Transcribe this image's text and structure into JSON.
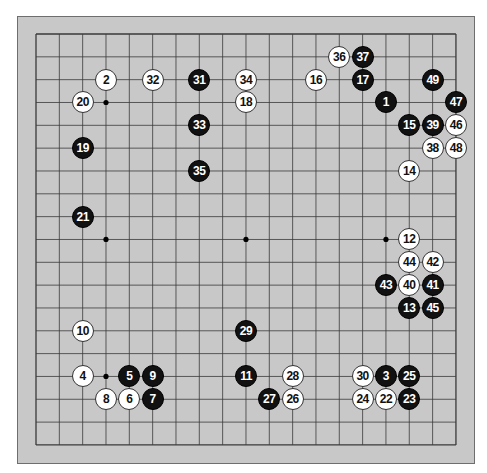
{
  "board": {
    "size": 19,
    "origin": {
      "x": 36,
      "y": 34
    },
    "spacing": {
      "x": 23.33,
      "y": 22.83
    },
    "colors": {
      "board": "#c8c8c8",
      "line": "#3a3a3a",
      "black": "#111111",
      "white": "#ffffff"
    },
    "star_points": [
      [
        3,
        3
      ],
      [
        9,
        3
      ],
      [
        15,
        3
      ],
      [
        3,
        9
      ],
      [
        9,
        9
      ],
      [
        15,
        9
      ],
      [
        3,
        15
      ],
      [
        9,
        15
      ],
      [
        15,
        15
      ]
    ]
  },
  "stones": [
    {
      "n": "1",
      "color": "black",
      "col": 15,
      "row": 3
    },
    {
      "n": "2",
      "color": "white",
      "col": 3,
      "row": 2
    },
    {
      "n": "3",
      "color": "black",
      "col": 15,
      "row": 15
    },
    {
      "n": "4",
      "color": "white",
      "col": 2,
      "row": 15
    },
    {
      "n": "5",
      "color": "black",
      "col": 4,
      "row": 15
    },
    {
      "n": "6",
      "color": "white",
      "col": 4,
      "row": 16
    },
    {
      "n": "7",
      "color": "black",
      "col": 5,
      "row": 16
    },
    {
      "n": "8",
      "color": "white",
      "col": 3,
      "row": 16
    },
    {
      "n": "9",
      "color": "black",
      "col": 5,
      "row": 15
    },
    {
      "n": "10",
      "color": "white",
      "col": 2,
      "row": 13
    },
    {
      "n": "11",
      "color": "black",
      "col": 9,
      "row": 15
    },
    {
      "n": "12",
      "color": "white",
      "col": 16,
      "row": 9
    },
    {
      "n": "13",
      "color": "black",
      "col": 16,
      "row": 12
    },
    {
      "n": "14",
      "color": "white",
      "col": 16,
      "row": 6
    },
    {
      "n": "15",
      "color": "black",
      "col": 16,
      "row": 4
    },
    {
      "n": "16",
      "color": "white",
      "col": 12,
      "row": 2
    },
    {
      "n": "17",
      "color": "black",
      "col": 14,
      "row": 2
    },
    {
      "n": "18",
      "color": "white",
      "col": 9,
      "row": 3
    },
    {
      "n": "19",
      "color": "black",
      "col": 2,
      "row": 5
    },
    {
      "n": "20",
      "color": "white",
      "col": 2,
      "row": 3
    },
    {
      "n": "21",
      "color": "black",
      "col": 2,
      "row": 8
    },
    {
      "n": "22",
      "color": "white",
      "col": 15,
      "row": 16
    },
    {
      "n": "23",
      "color": "black",
      "col": 16,
      "row": 16
    },
    {
      "n": "24",
      "color": "white",
      "col": 14,
      "row": 16
    },
    {
      "n": "25",
      "color": "black",
      "col": 16,
      "row": 15
    },
    {
      "n": "26",
      "color": "white",
      "col": 11,
      "row": 16
    },
    {
      "n": "27",
      "color": "black",
      "col": 10,
      "row": 16
    },
    {
      "n": "28",
      "color": "white",
      "col": 11,
      "row": 15
    },
    {
      "n": "29",
      "color": "black",
      "col": 9,
      "row": 13
    },
    {
      "n": "30",
      "color": "white",
      "col": 14,
      "row": 15
    },
    {
      "n": "31",
      "color": "black",
      "col": 7,
      "row": 2
    },
    {
      "n": "32",
      "color": "white",
      "col": 5,
      "row": 2
    },
    {
      "n": "33",
      "color": "black",
      "col": 7,
      "row": 4
    },
    {
      "n": "34",
      "color": "white",
      "col": 9,
      "row": 2
    },
    {
      "n": "35",
      "color": "black",
      "col": 7,
      "row": 6
    },
    {
      "n": "36",
      "color": "white",
      "col": 13,
      "row": 1
    },
    {
      "n": "37",
      "color": "black",
      "col": 14,
      "row": 1
    },
    {
      "n": "38",
      "color": "white",
      "col": 17,
      "row": 5
    },
    {
      "n": "39",
      "color": "black",
      "col": 17,
      "row": 4
    },
    {
      "n": "40",
      "color": "white",
      "col": 16,
      "row": 11
    },
    {
      "n": "41",
      "color": "black",
      "col": 17,
      "row": 11
    },
    {
      "n": "42",
      "color": "white",
      "col": 17,
      "row": 10
    },
    {
      "n": "43",
      "color": "black",
      "col": 15,
      "row": 11
    },
    {
      "n": "44",
      "color": "white",
      "col": 16,
      "row": 10
    },
    {
      "n": "45",
      "color": "black",
      "col": 17,
      "row": 12
    },
    {
      "n": "46",
      "color": "white",
      "col": 18,
      "row": 4
    },
    {
      "n": "47",
      "color": "black",
      "col": 18,
      "row": 3
    },
    {
      "n": "48",
      "color": "white",
      "col": 18,
      "row": 5
    },
    {
      "n": "49",
      "color": "black",
      "col": 17,
      "row": 2
    }
  ]
}
